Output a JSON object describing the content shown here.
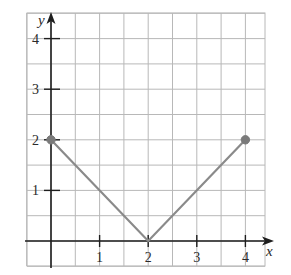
{
  "chart_data": {
    "type": "line",
    "title": "",
    "xlabel": "x",
    "ylabel": "y",
    "xlim": [
      -0.5,
      4.4
    ],
    "ylim": [
      -0.5,
      4.5
    ],
    "grid": true,
    "grid_step": 0.5,
    "x_ticks": [
      1,
      2,
      3,
      4
    ],
    "y_ticks": [
      1,
      2,
      3,
      4
    ],
    "x_tick_labels": [
      "1",
      "2",
      "3",
      "4"
    ],
    "y_tick_labels": [
      "1",
      "2",
      "3",
      "4"
    ],
    "series": [
      {
        "name": "y = |x - 2|",
        "x": [
          0,
          2,
          4
        ],
        "y": [
          2,
          0,
          2
        ],
        "color": "#8a8a8a",
        "endpoints": [
          {
            "x": 0,
            "y": 2,
            "style": "filled"
          },
          {
            "x": 4,
            "y": 2,
            "style": "filled"
          }
        ]
      }
    ],
    "legend": null
  },
  "colors": {
    "grid": "#b8b8b8",
    "axis": "#1e1e1e",
    "line": "#8a8a8a",
    "point": "#7a7a7a",
    "text": "#2a2a2a"
  }
}
